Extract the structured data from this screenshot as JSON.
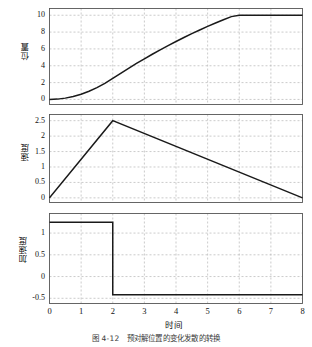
{
  "figure": {
    "caption": "图 4-12　预对解位置的变化发散的转换",
    "xlabel": "时间",
    "xticks": [
      "0",
      "1",
      "2",
      "3",
      "4",
      "5",
      "6",
      "7",
      "8"
    ],
    "grid_color": "#b4b4b4",
    "line_color": "#1a1a1a",
    "axis_color": "#555555"
  },
  "chart_data": [
    {
      "type": "line",
      "title": "",
      "ylabel": "位置",
      "xlabel": "",
      "xlim": [
        0,
        8
      ],
      "ylim": [
        -0.6,
        10.8
      ],
      "yticks": [
        0,
        2,
        4,
        6,
        8,
        10
      ],
      "ytick_labels": [
        "0",
        "2",
        "4",
        "6",
        "8",
        "10"
      ],
      "grid": true,
      "x": [
        0,
        0.25,
        0.5,
        0.75,
        1,
        1.25,
        1.5,
        1.75,
        2,
        2.25,
        2.5,
        2.75,
        3,
        3.25,
        3.5,
        3.75,
        4,
        4.25,
        4.5,
        4.75,
        5,
        5.25,
        5.5,
        5.75,
        6,
        6.25,
        6.5,
        6.75,
        7,
        7.25,
        7.5,
        7.75,
        8
      ],
      "y": [
        0,
        0.039,
        0.156,
        0.352,
        0.625,
        0.977,
        1.406,
        1.914,
        2.5,
        3.107,
        3.698,
        4.271,
        4.828,
        5.367,
        5.891,
        6.396,
        6.885,
        7.357,
        7.813,
        8.251,
        8.672,
        9.077,
        9.464,
        9.835,
        10.0,
        10.0,
        10.0,
        10.0,
        10.0,
        10.0,
        10.0,
        10.0,
        10.0
      ]
    },
    {
      "type": "line",
      "title": "",
      "ylabel": "速度",
      "xlabel": "",
      "xlim": [
        0,
        8
      ],
      "ylim": [
        -0.15,
        2.7
      ],
      "yticks": [
        0,
        0.5,
        1,
        1.5,
        2,
        2.5
      ],
      "ytick_labels": [
        "0",
        "0.5",
        "1",
        "1.5",
        "2",
        "2.5"
      ],
      "grid": true,
      "x": [
        0,
        2,
        8
      ],
      "y": [
        0,
        2.5,
        0
      ]
    },
    {
      "type": "line",
      "title": "",
      "ylabel": "加速度",
      "xlabel": "时间",
      "xlim": [
        0,
        8
      ],
      "ylim": [
        -0.62,
        1.45
      ],
      "yticks": [
        -0.5,
        0,
        0.5,
        1
      ],
      "ytick_labels": [
        "-0.5",
        "0",
        "0.5",
        "1"
      ],
      "grid": true,
      "x": [
        0,
        2,
        2,
        8
      ],
      "y": [
        1.25,
        1.25,
        -0.4167,
        -0.4167
      ]
    }
  ]
}
